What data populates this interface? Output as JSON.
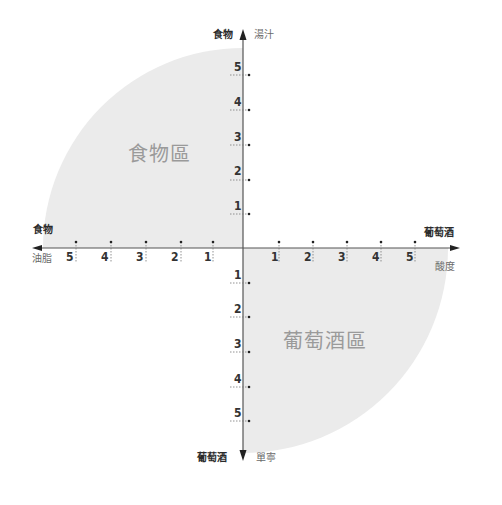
{
  "diagram": {
    "title": "",
    "axes": {
      "top": {
        "bold_label": "食物",
        "light_label": "湯汁"
      },
      "bottom": {
        "bold_label": "葡萄酒",
        "light_label": "單寧"
      },
      "left": {
        "bold_label": "食物",
        "light_label": "油脂"
      },
      "right": {
        "bold_label": "葡萄酒",
        "light_label": "酸度"
      }
    },
    "regions": {
      "top_left": "食物區",
      "bottom_right": "葡萄酒區"
    },
    "ticks": {
      "left": [
        "5",
        "4",
        "3",
        "2",
        "1"
      ],
      "right": [
        "1",
        "2",
        "3",
        "4",
        "5"
      ],
      "up": [
        "5",
        "4",
        "3",
        "2",
        "1"
      ],
      "down": [
        "1",
        "2",
        "3",
        "4",
        "5"
      ]
    },
    "colors": {
      "region_fill": "#ebebeb",
      "axis": "#555555"
    }
  }
}
